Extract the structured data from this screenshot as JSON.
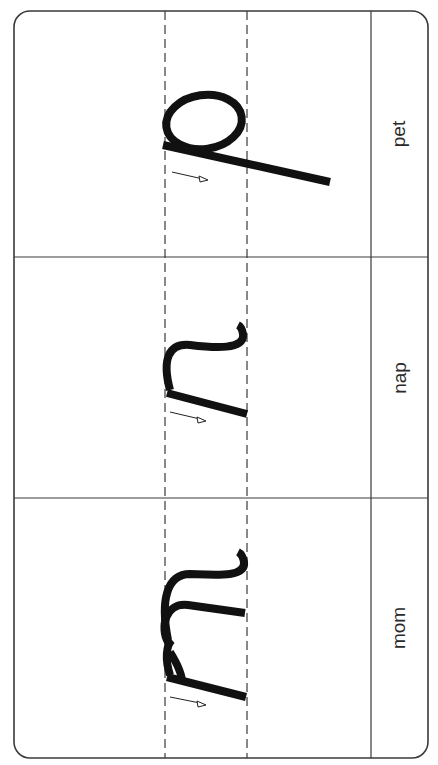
{
  "worksheet": {
    "type": "handwriting-practice",
    "orientation": "rotated-90",
    "colors": {
      "border": "#3a3a3a",
      "guide_dash": "#3a3a3a",
      "letter": "#111111",
      "text": "#2a2a2a",
      "background": "#ffffff"
    },
    "rows": [
      {
        "letter": "p",
        "word": "pet",
        "stroke_arrow": "direction-arrow-icon"
      },
      {
        "letter": "n",
        "word": "nap",
        "stroke_arrow": "direction-arrow-icon"
      },
      {
        "letter": "m",
        "word": "mom",
        "stroke_arrow": "direction-arrow-icon"
      }
    ]
  }
}
